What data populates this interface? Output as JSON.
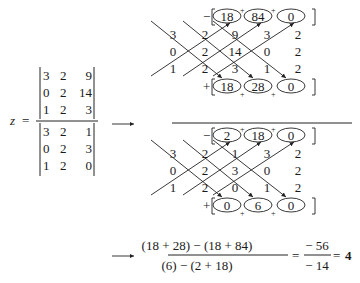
{
  "lhs": {
    "variable": "z",
    "equals": "="
  },
  "numerator_matrix": [
    [
      "3",
      "2",
      "9"
    ],
    [
      "0",
      "2",
      "14"
    ],
    [
      "1",
      "2",
      "3"
    ]
  ],
  "denominator_matrix": [
    [
      "3",
      "2",
      "1"
    ],
    [
      "0",
      "2",
      "3"
    ],
    [
      "1",
      "2",
      "0"
    ]
  ],
  "arrow_glyph": "→",
  "grid_numerator": {
    "rows": [
      [
        "3",
        "2",
        "9",
        "3",
        "2"
      ],
      [
        "0",
        "2",
        "14",
        "0",
        "2"
      ],
      [
        "1",
        "2",
        "3",
        "1",
        "2"
      ]
    ],
    "minus_products": [
      "18",
      "84",
      "0"
    ],
    "plus_products": [
      "18",
      "28",
      "0"
    ]
  },
  "grid_denominator": {
    "rows": [
      [
        "3",
        "2",
        "1",
        "3",
        "2"
      ],
      [
        "0",
        "2",
        "3",
        "0",
        "2"
      ],
      [
        "1",
        "2",
        "0",
        "1",
        "2"
      ]
    ],
    "minus_products": [
      "2",
      "18",
      "0"
    ],
    "plus_products": [
      "0",
      "6",
      "0"
    ]
  },
  "signs": {
    "minus": "−",
    "plus": "+"
  },
  "result": {
    "numerator_expr": "(18 + 28) − (18 + 84)",
    "denominator_expr": "(6) − (2 + 18)",
    "frac_num": "− 56",
    "frac_den": "− 14",
    "equals": "=",
    "value": "4"
  }
}
